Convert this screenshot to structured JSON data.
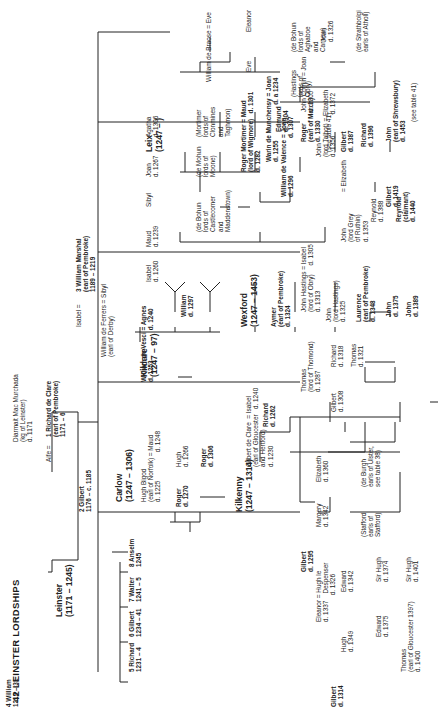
{
  "title": "42  LEINSTER LORDSHIPS",
  "regions": {
    "leinster": "Leinster\n(1171 – 1245)",
    "carlow": "Carlow\n(1247 – 1306)",
    "kildare": "Kildare\n(1247 – 97)",
    "kilkenny": "Kilkenny\n(1247 – 1314)",
    "leix": "Leix\n(1247 – )",
    "wexford": "Wexford\n(1247 – 1453)"
  },
  "people": {
    "diarmait": "Diarmait Mac Murchada\n(kg of Leinster)\nd. 1171",
    "aife": "Aife =",
    "richard_de_clare": "1 Richard de Clare\n(earl of Pembroke)\n1171 – 6",
    "gilbert2": "2 Gilbert\n1176 – c. 1185",
    "isabel": "Isabel =",
    "william_marshal": "3 William Marshal\n(earl of Pembroke)\n1189 – 1219",
    "william4": "4 William\n1219 – 31",
    "richard5": "5 Richard\n1231 – 4",
    "gilbert6": "6 Gilbert\n1234 – 41",
    "walter7": "7 Walter\n1241 – 5",
    "anselm8": "8 Anselm\n1245",
    "hugh_bigod": "Hugh Bigod\n(earl of Norfolk) = Maud\nd. 1225                d. 1248",
    "roger1270": "Roger\nd. 1270",
    "hugh1266": "Hugh\nd. 1266",
    "roger1306": "Roger\nd. 1306",
    "william_ferrers": "William de Ferrers = Sibyl\n(earl of Derby)",
    "william_vesci": "William de Vesci = Agnes\nd. 1253                 d. 1240",
    "william1297": "William\nd. 1297",
    "isabel1260": "Isabel\nd. 1260",
    "maud1239": "Maud\nd. 1239",
    "sibyl": "Sibyl",
    "joan1267": "Joan\nd. 1267",
    "agatha1306": "Agatha\nd. 1306",
    "de_bohun_castlecomer": "(de Bohun\nlords of\nCastlecomer\nand\nMaddenstown)",
    "de_mohun": "(de Mohun\nlords of\nMoone)",
    "mortimer_lords": "(Mortimer\nlords of\nClonmines\nand\nTaghmon)",
    "gilbert_de_clare": "Gilbert de Clare  = Isabel\n(earl of Gloucester   d. 1240\nand Hertford)\nd. 1230",
    "richard1262": "Richard\nd. 1262",
    "gilbert1295": "Gilbert\nd. 1295",
    "thomas1287": "Thomas\n(lord of Thomond)\nd. 1287",
    "gilbert1308": "Gilbert\nd. 1308",
    "richard1318": "Richard\nd. 1318",
    "thomas1321": "Thomas\nd. 1321",
    "gilbert1314": "Gilbert\nd. 1314",
    "eleanor": "Eleanor = Hugh le\nd. 1337    Despenser\n               d. 1326",
    "margery": "Margery\nd. 1342",
    "elizabeth1360": "Elizabeth\nd. 1360",
    "stafford": "(Stafford\nearls of\nStafford)",
    "de_burgh": "(de Burgh\nearls of Ulster,\nsee table 38)",
    "hugh1349": "Hugh\nd. 1349",
    "edward1342": "Edward\nd. 1342",
    "edward1375": "Edward\nd. 1375",
    "sir_hugh1374": "Sir Hugh\nd. 1374",
    "thomas1400": "Thomas\n(earl of Gloucester 1397)\nd. 1400",
    "sir_hugh1401": "Sir Hugh\nd. 1401",
    "roger_mortimer": "Roger Mortimer = Maud\n(lord of Wigmore)   d. 1301\nd. 1282",
    "william_braose": "William de Braose = Eve",
    "eve": "Eve",
    "eleanor_b": "Eleanor",
    "edmund1304": "Edmund\nd. 1304",
    "roger1330": "Roger\n(earl of March)\nd. 1330",
    "see41a": "(see table 41)",
    "hastings_lords": "(Hastings\nlords of\nObry)",
    "de_bohun_aghaboe": "(de Bohun\nlords of\nAghaboe\nand\nCarnew)",
    "aymer": "Aymer\n(earl of Pembroke)\nd. 1324",
    "john_hastings": "John Hastings = Isabel\n(lord of Obry)     d. 1305\nd. 1313",
    "john1325": "John\n(lord Hastings)\nd. 1325",
    "laurence": "Laurence\n(earl of Pembroke)\nd. 1348",
    "john1375": "John\nd. 1375",
    "john1389": "John\nd. 1389",
    "john_grey": "John\n(lord Grey\nof Ruthin)\nd. 1353",
    "elizabeth_grey": "= Elizabeth",
    "reynold1388": "Reynold\nd. 1388",
    "reynold1440": "Reynold\n(claimant)\nd. 1440",
    "warin": "Warin de Munchensy = Joan\nd. 1255                    d. a 1234",
    "william_valence": "William de Valence = Joan\nd. 1296                     d. 1307",
    "john_comin": "John Comin = Joan\nd. 1305",
    "joan1326": "Joan\nd. 1326",
    "strathbolgi": "(de Strathbolgi\nearls of Atholl)",
    "john_talbot": "John\n(lord Talbot) = Elizabeth\nd. 1356            d. 1372",
    "gilbert1387": "Gilbert\nd. 1387",
    "richard1396": "Richard\nd. 1396",
    "gilbert1419": "Gilbert\nd. 1419",
    "john1453": "John\n(earl of Shrewsbury)\nd. 1453",
    "see41b": "(see table 41)"
  }
}
